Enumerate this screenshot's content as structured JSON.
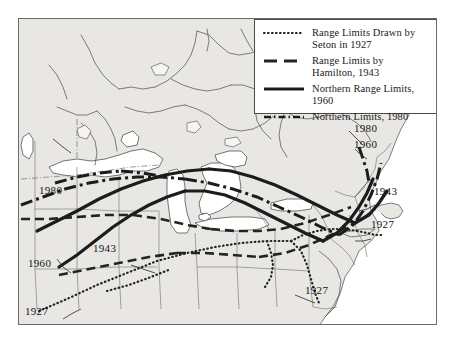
{
  "figure": {
    "type": "map",
    "region": "Northeastern North America / Great Lakes",
    "background_color": "#ffffff",
    "land_fill": "#e9e7e4",
    "frame_color": "#6b6b6b",
    "line_color": "#2b2b2b"
  },
  "legend": {
    "border_color": "#4a4a4a",
    "background": "#ffffff",
    "entries": [
      {
        "key": "dotted",
        "label_line1": "Range Limits Drawn by",
        "label_line2": "Seton in 1927"
      },
      {
        "key": "dashed",
        "label_line1": "Range Limits by",
        "label_line2": "Hamilton, 1943"
      },
      {
        "key": "solid",
        "label_line1": "Northern Range Limits, 1960",
        "label_line2": ""
      },
      {
        "key": "dashdot",
        "label_line1": "Northern Limits, 1980",
        "label_line2": ""
      }
    ]
  },
  "annotations": [
    {
      "name": "year-1980-west",
      "text": "1980",
      "x": 20,
      "y": 165
    },
    {
      "name": "year-1980-east",
      "text": "1980",
      "x": 353,
      "y": 121
    },
    {
      "name": "year-1960-east",
      "text": "1960",
      "x": 353,
      "y": 137
    },
    {
      "name": "year-1943-east",
      "text": "1943",
      "x": 373,
      "y": 184
    },
    {
      "name": "year-1927-east",
      "text": "1927",
      "x": 370,
      "y": 217
    },
    {
      "name": "year-1943-center",
      "text": "1943",
      "x": 92,
      "y": 241
    },
    {
      "name": "year-1960-west",
      "text": "1960",
      "x": 27,
      "y": 256
    },
    {
      "name": "year-1927-southwest",
      "text": "1927",
      "x": 24,
      "y": 304
    },
    {
      "name": "year-1927-south",
      "text": "1927",
      "x": 304,
      "y": 283
    }
  ]
}
